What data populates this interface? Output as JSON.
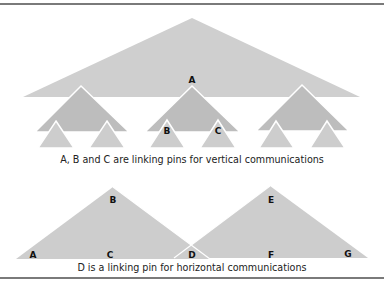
{
  "figure": {
    "top_section": {
      "caption": "A, B and C are linking pins for vertical communications",
      "labels": {
        "A": "A",
        "B": "B",
        "C": "C"
      }
    },
    "bottom_section": {
      "caption": "D is a linking pin for horizontal communications",
      "labels": {
        "A": "A",
        "B": "B",
        "C": "C",
        "D": "D",
        "E": "E",
        "F": "F",
        "G": "G"
      }
    },
    "colors": {
      "top_triangle": "#cfcfcf",
      "mid_triangle": "#bdbdbd",
      "small_triangle": "#cdcdcd",
      "bottom_triangle": "#cdcdcd",
      "outline": "#ffffff",
      "rule": "#7a7a7a"
    }
  }
}
